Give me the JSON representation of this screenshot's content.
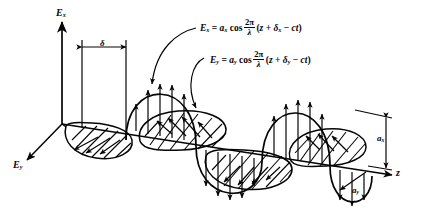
{
  "axes": {
    "vertical": {
      "name": "Ex-axis",
      "label_html": "E<sub>x</sub>",
      "label_text": "Ex"
    },
    "depth": {
      "name": "Ey-axis",
      "label_html": "E<sub>y</sub>",
      "label_text": "Ey"
    },
    "propagation": {
      "name": "z-axis",
      "label_html": "z",
      "label_text": "z"
    }
  },
  "annotations": {
    "phase_shift": {
      "symbol": "δ",
      "name": "delta-phase-offset"
    },
    "amplitude_x": {
      "label_text": "ax",
      "symbol": "a",
      "subscript": "x"
    },
    "amplitude_y": {
      "label_text": "ay",
      "symbol": "a",
      "subscript": "y"
    }
  },
  "equations": [
    {
      "name": "ex-equation",
      "lhs": "E",
      "lhs_sub": "x",
      "amplitude": "a",
      "amplitude_sub": "x",
      "fn": "cos",
      "frac_num": "2π",
      "frac_den": "λ",
      "arg": "(z + δ",
      "arg_sub": "x",
      "arg_tail": " − ct)",
      "plain": "Ex = ax cos (2π/λ)(z + δx − ct)"
    },
    {
      "name": "ey-equation",
      "lhs": "E",
      "lhs_sub": "y",
      "amplitude": "a",
      "amplitude_sub": "y",
      "fn": "cos",
      "frac_num": "2π",
      "frac_den": "λ",
      "arg": "(z + δ",
      "arg_sub": "y",
      "arg_tail": " − ct)",
      "plain": "Ey = ay cos (2π/λ)(z + δy − ct)"
    }
  ],
  "colors": {
    "ink": "#050505",
    "background": "#ffffff"
  }
}
